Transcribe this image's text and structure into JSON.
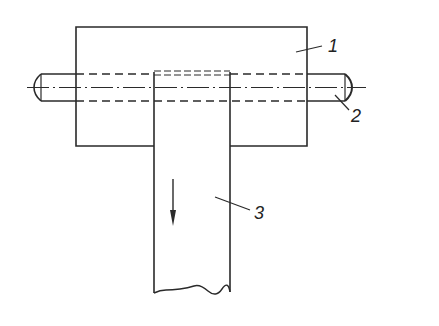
{
  "diagram": {
    "type": "technical-drawing",
    "colors": {
      "line": "#2a2a2a",
      "background": "#ffffff"
    },
    "parts": [
      {
        "id": "block",
        "label": "1"
      },
      {
        "id": "shaft",
        "label": "2"
      },
      {
        "id": "bar",
        "label": "3"
      }
    ],
    "arrow": {
      "direction": "down"
    }
  }
}
